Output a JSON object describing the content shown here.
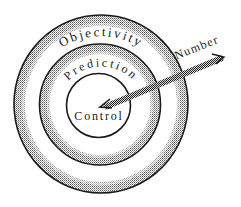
{
  "diagram": {
    "type": "concentric-target",
    "rings": [
      {
        "id": "outer",
        "label": "Objectivity"
      },
      {
        "id": "middle",
        "label": "Prediction"
      },
      {
        "id": "inner",
        "label": "Control"
      }
    ],
    "arrow": {
      "label": "Number",
      "target": "inner"
    },
    "colors": {
      "outline": "#1a1a1a",
      "stipple": "#6b6b6b",
      "background": "#ffffff"
    }
  }
}
